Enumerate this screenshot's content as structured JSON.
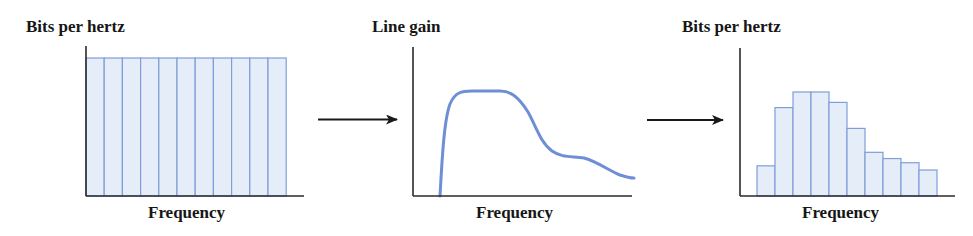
{
  "panels": [
    {
      "title": "Bits per hertz",
      "xlabel": "Frequency",
      "kind": "bars",
      "description": "Uniform bit allocation across all subchannels"
    },
    {
      "title": "Line gain",
      "xlabel": "Frequency",
      "kind": "curve",
      "description": "Line gain response versus frequency"
    },
    {
      "title": "Bits per hertz",
      "xlabel": "Frequency",
      "kind": "bars",
      "description": "Bit allocation adapted to line gain"
    }
  ],
  "colors": {
    "bar_fill": "#e5edf9",
    "bar_stroke": "#7f9ed9",
    "curve": "#6f8ed6",
    "axis": "#2a2a2a",
    "arrow": "#1a1a1a",
    "text": "#161616"
  },
  "chart_data": [
    {
      "type": "bar",
      "title": "Bits per hertz",
      "xlabel": "Frequency",
      "ylabel": "Bits per hertz",
      "categories": [
        "1",
        "2",
        "3",
        "4",
        "5",
        "6",
        "7",
        "8",
        "9",
        "10",
        "11"
      ],
      "values": [
        100,
        100,
        100,
        100,
        100,
        100,
        100,
        100,
        100,
        100,
        100
      ],
      "grid": false
    },
    {
      "type": "line",
      "title": "Line gain",
      "xlabel": "Frequency",
      "ylabel": "Line gain",
      "x": [
        0,
        0.04,
        0.1,
        0.2,
        0.3,
        0.4,
        0.5,
        0.6,
        0.7,
        0.8,
        0.9,
        1.0
      ],
      "values": [
        0,
        60,
        90,
        100,
        100,
        98,
        82,
        55,
        40,
        38,
        30,
        20
      ],
      "grid": false
    },
    {
      "type": "bar",
      "title": "Bits per hertz",
      "xlabel": "Frequency",
      "ylabel": "Bits per hertz",
      "categories": [
        "1",
        "2",
        "3",
        "4",
        "5",
        "6",
        "7",
        "8",
        "9",
        "10"
      ],
      "values": [
        29,
        85,
        100,
        100,
        90,
        65,
        42,
        36,
        32,
        25
      ],
      "grid": false
    }
  ]
}
